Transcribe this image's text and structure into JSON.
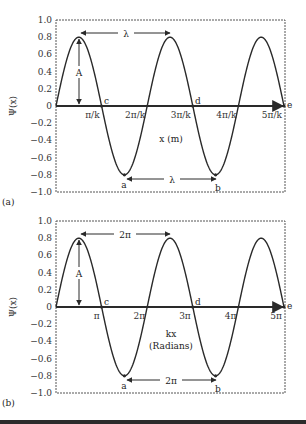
{
  "chart_data": [
    {
      "panel": "(a)",
      "type": "line",
      "function": "Psi(x) = 0.8 sin(kx)",
      "x": [
        "0",
        "π/k",
        "2π/k",
        "3π/k",
        "4π/k",
        "5π/k"
      ],
      "x_numeric_units_of_pi_over_k": [
        0,
        1,
        2,
        3,
        4,
        5
      ],
      "amplitude": 0.8,
      "ylabel": "Ψ(x)",
      "xlabel": "x (m)",
      "ylim": [
        -1.0,
        1.0
      ],
      "yticks": [
        "1.0",
        "0.8",
        "0.6",
        "0.4",
        "0.2",
        "0",
        "−0.2",
        "−0.4",
        "−0.6",
        "−0.8",
        "−1.0"
      ],
      "xtick_labels": [
        "π/k",
        "2π/k",
        "3π/k",
        "4π/k",
        "5π/k"
      ],
      "points": {
        "a": "trough at 3π/(2k), −0.8",
        "b": "trough at 7π/(2k), −0.8",
        "c": "zero at π/k",
        "d": "zero at 3π/k",
        "e": "zero at 5π/k"
      },
      "annotations": {
        "amplitude_label": "A",
        "wavelength_top": "λ",
        "wavelength_bottom": "λ"
      },
      "grid": false
    },
    {
      "panel": "(b)",
      "type": "line",
      "function": "Psi = 0.8 sin(kx)",
      "x": [
        "0",
        "π",
        "2π",
        "3π",
        "4π",
        "5π"
      ],
      "x_numeric_units_of_pi": [
        0,
        1,
        2,
        3,
        4,
        5
      ],
      "amplitude": 0.8,
      "ylabel": "Ψ(x)",
      "xlabel": "kx (Radians)",
      "ylim": [
        -1.0,
        1.0
      ],
      "yticks": [
        "1.0",
        "0.8",
        "0.6",
        "0.4",
        "0.2",
        "0",
        "−0.2",
        "−0.4",
        "−0.6",
        "−0.8",
        "−1.0"
      ],
      "xtick_labels": [
        "π",
        "2π",
        "3π",
        "4π",
        "5π"
      ],
      "points": {
        "a": "trough at 3π/2, −0.8",
        "b": "trough at 7π/2, −0.8",
        "c": "zero at π",
        "d": "zero at 3π",
        "e": "zero at 5π"
      },
      "annotations": {
        "amplitude_label": "A",
        "wavelength_top": "2π",
        "wavelength_bottom": "2π"
      },
      "grid": false
    }
  ],
  "panels": {
    "a": {
      "label": "(a)",
      "ylabel": "Ψ(x)",
      "xlabel": "x (m)",
      "xlabel2": "",
      "xticks": [
        "π/k",
        "2π/k",
        "3π/k",
        "4π/k",
        "5π/k"
      ],
      "period_top": "λ",
      "period_bottom": "λ",
      "amp": "A",
      "pt_a": "a",
      "pt_b": "b",
      "pt_c": "c",
      "pt_d": "d",
      "pt_e": "e"
    },
    "b": {
      "label": "(b)",
      "ylabel": "Ψ(x)",
      "xlabel": "kx",
      "xlabel2": "(Radians)",
      "xticks": [
        "π",
        "2π",
        "3π",
        "4π",
        "5π"
      ],
      "period_top": "2π",
      "period_bottom": "2π",
      "amp": "A",
      "pt_a": "a",
      "pt_b": "b",
      "pt_c": "c",
      "pt_d": "d",
      "pt_e": "e"
    }
  },
  "yticks": [
    "1.0",
    "0.8",
    "0.6",
    "0.4",
    "0.2",
    "0",
    "−0.2",
    "−0.4",
    "−0.6",
    "−0.8",
    "−1.0"
  ],
  "colors": {
    "curve": "#2a2a2a",
    "axis": "#2a2a2a",
    "frame": "#444444",
    "text": "#333333"
  }
}
